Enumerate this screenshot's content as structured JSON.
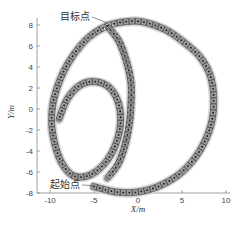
{
  "chart_data": {
    "type": "line",
    "title": "",
    "xlabel": "X/m",
    "ylabel": "Y/m",
    "xlim": [
      -11,
      10
    ],
    "ylim": [
      -8.5,
      9
    ],
    "xticks": [
      -10,
      -5,
      0,
      5,
      10
    ],
    "yticks": [
      8,
      6,
      4,
      2,
      0,
      -2,
      -4,
      -6,
      -8
    ],
    "grid": false,
    "annotations": [
      {
        "text": "目标点",
        "x": -3.5,
        "y": 8.2
      },
      {
        "text": "起始点",
        "x": -5.0,
        "y": -7.3
      }
    ],
    "series": [
      {
        "name": "trajectory",
        "x": [
          -5.0,
          -2.5,
          0,
          2.5,
          5,
          7,
          8.3,
          8.6,
          8.2,
          7,
          5,
          3,
          0.5,
          -1.5,
          -3.5,
          -5.5,
          -7.2,
          -8.6,
          -9.6,
          -9.8,
          -9.3,
          -8.4,
          -7.2,
          -5.5,
          -3.8,
          -2.6,
          -2.0,
          -2.2,
          -3.2,
          -4.8,
          -6.5,
          -8.0,
          -9.0
        ],
        "y": [
          -7.4,
          -7.9,
          -7.9,
          -7.3,
          -6.0,
          -4.0,
          -1.5,
          1.0,
          3.2,
          5.0,
          6.5,
          7.6,
          8.3,
          8.3,
          7.9,
          6.9,
          5.3,
          3.3,
          0.8,
          -1.5,
          -3.8,
          -5.5,
          -6.4,
          -6.3,
          -5.2,
          -3.5,
          -1.5,
          0.5,
          2.0,
          2.6,
          2.3,
          1.0,
          -1.0
        ]
      },
      {
        "name": "inner-strand",
        "x": [
          -3.5,
          -2.2,
          -1.3,
          -0.8,
          -0.8,
          -1.0,
          -1.5,
          -2.3,
          -3.5
        ],
        "y": [
          7.9,
          6.5,
          4.5,
          2.5,
          0.5,
          -1.5,
          -3.5,
          -5.3,
          -6.6
        ]
      }
    ],
    "markers": "square boxes with center dots along each trajectory"
  }
}
